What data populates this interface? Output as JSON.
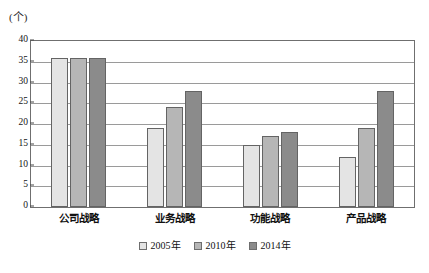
{
  "chart_data": {
    "type": "bar",
    "title": "",
    "subtitle": "",
    "xlabel": "",
    "ylabel": "",
    "unit_label": "(个)",
    "categories": [
      "公司战略",
      "业务战略",
      "功能战略",
      "产品战略"
    ],
    "series": [
      {
        "name": "2005年",
        "values": [
          36,
          19,
          15,
          12
        ],
        "color": "#e4e4e4"
      },
      {
        "name": "2010年",
        "values": [
          36,
          24,
          17,
          19
        ],
        "color": "#b6b6b6"
      },
      {
        "name": "2014年",
        "values": [
          36,
          28,
          18,
          28
        ],
        "color": "#8b8b8b"
      }
    ],
    "ylim": [
      0,
      40
    ],
    "ytick_step": 5,
    "yticks": [
      0,
      5,
      10,
      15,
      20,
      25,
      30,
      35,
      40
    ],
    "ytick_labels": [
      "0",
      "5",
      "10",
      "15",
      "20",
      "25",
      "30",
      "35",
      "40"
    ],
    "grid": true,
    "grid_axis": "y",
    "legend_position": "bottom",
    "plot_border_color": "#6f6f6f",
    "gridline_color": "#9a9a9a",
    "bar_border_color": "#646464"
  }
}
